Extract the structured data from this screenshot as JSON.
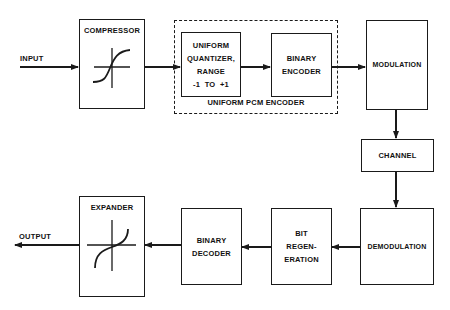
{
  "diagram": {
    "input_label": "INPUT",
    "output_label": "OUTPUT",
    "blocks": {
      "compressor": {
        "label": "COMPRESSOR"
      },
      "quantizer": {
        "lines": [
          "UNIFORM",
          "QUANTIZER,",
          "RANGE",
          "-1  TO  +1"
        ]
      },
      "binary_encoder": {
        "lines": [
          "BINARY",
          "ENCODER"
        ]
      },
      "pcm_group": {
        "label": "UNIFORM  PCM ENCODER"
      },
      "modulation": {
        "label": "MODULATION"
      },
      "channel": {
        "label": "CHANNEL"
      },
      "demodulation": {
        "label": "DEMODULATION"
      },
      "bit_regeneration": {
        "lines": [
          "BIT",
          "REGEN-",
          "ERATION"
        ]
      },
      "binary_decoder": {
        "lines": [
          "BINARY",
          "DECODER"
        ]
      },
      "expander": {
        "label": "EXPANDER"
      }
    },
    "flow": [
      "INPUT",
      "COMPRESSOR",
      "UNIFORM QUANTIZER",
      "BINARY ENCODER",
      "MODULATION",
      "CHANNEL",
      "DEMODULATION",
      "BIT REGENERATION",
      "BINARY DECODER",
      "EXPANDER",
      "OUTPUT"
    ],
    "colors": {
      "line": "#1a1a1a",
      "background": "#ffffff"
    }
  }
}
